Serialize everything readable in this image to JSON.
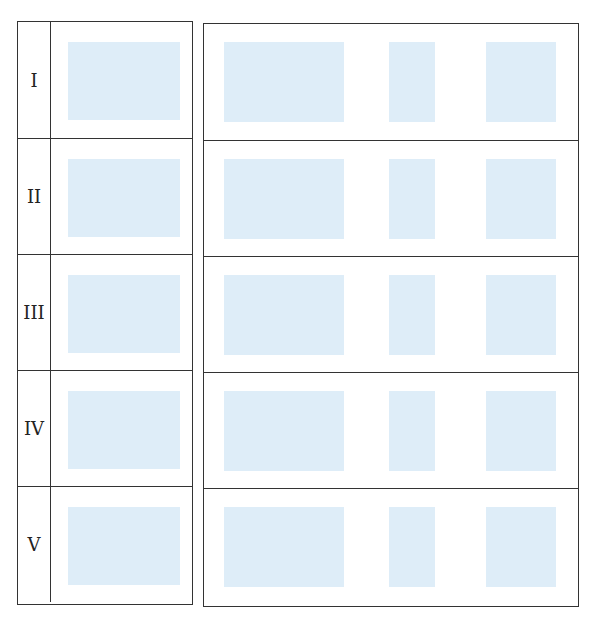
{
  "stages": [
    {
      "label": "I"
    },
    {
      "label": "II"
    },
    {
      "label": "III"
    },
    {
      "label": "IV"
    },
    {
      "label": "V"
    }
  ],
  "colors": {
    "panel": "#deedf8",
    "line": "#333333"
  }
}
